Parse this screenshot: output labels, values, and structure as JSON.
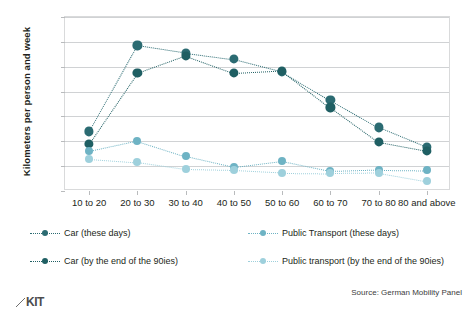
{
  "chart_data": {
    "type": "line",
    "title": "",
    "xlabel": "",
    "ylabel": "Kilometers per person and week",
    "ylim": [
      0,
      350
    ],
    "yticks": [
      0,
      50,
      100,
      150,
      200,
      250,
      300,
      350
    ],
    "grid": true,
    "legend_position": "bottom",
    "categories": [
      "10 to 20",
      "20 to 30",
      "30 to 40",
      "40 to 50",
      "50 to 60",
      "60 to 70",
      "70 to 80",
      "80 and above"
    ],
    "series": [
      {
        "name": "Car (these days)",
        "color": "#2b6b72",
        "values": [
          120,
          293,
          278,
          265,
          240,
          183,
          128,
          88
        ]
      },
      {
        "name": "Car (by the end of the 90ies)",
        "color": "#1f5f63",
        "values": [
          95,
          237,
          272,
          237,
          242,
          168,
          98,
          80
        ]
      },
      {
        "name": "Public Transport (these days)",
        "color": "#6eb3c4",
        "values": [
          80,
          101,
          70,
          48,
          60,
          40,
          43,
          42
        ]
      },
      {
        "name": "Public transport (by the end of the 90ies)",
        "color": "#9ed0dc",
        "values": [
          65,
          58,
          44,
          42,
          37,
          36,
          37,
          20
        ]
      }
    ]
  },
  "source": {
    "text": "Source: German Mobility Panel"
  },
  "branding": {
    "logo_text": "KIT"
  }
}
